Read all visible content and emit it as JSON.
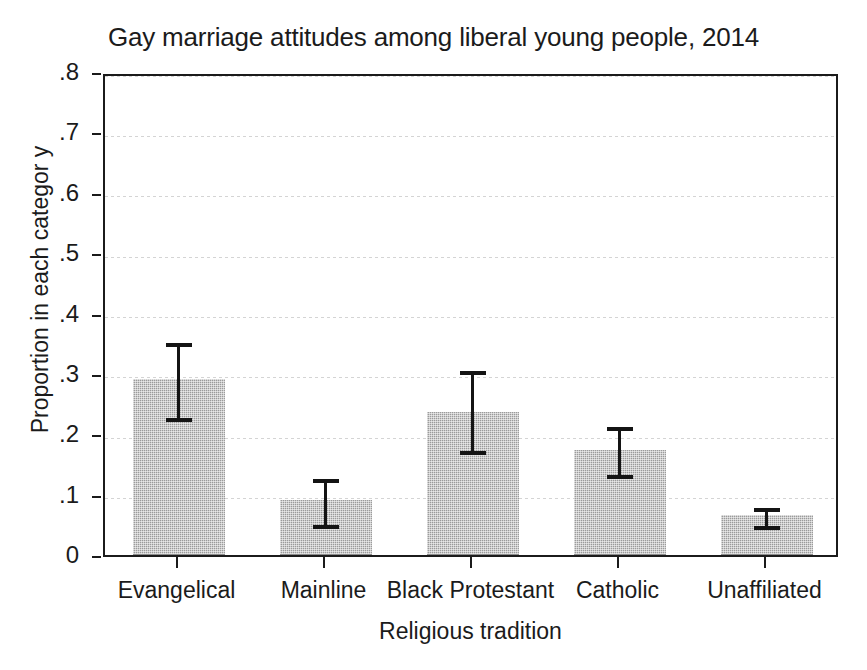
{
  "chart_data": {
    "type": "bar",
    "title": "Gay marriage attitudes among liberal young people, 2014",
    "xlabel": "Religious tradition",
    "ylabel": "Proportion in each categor y",
    "categories": [
      "Evangelical",
      "Mainline",
      "Black Protestant",
      "Catholic",
      "Unaffiliated"
    ],
    "values": [
      0.29,
      0.09,
      0.235,
      0.173,
      0.065
    ],
    "error_low": [
      0.231,
      0.053,
      0.175,
      0.136,
      0.052
    ],
    "error_high": [
      0.355,
      0.129,
      0.308,
      0.216,
      0.081
    ],
    "ylim": [
      0,
      0.8
    ],
    "yticks": [
      0,
      0.1,
      0.2,
      0.3,
      0.4,
      0.5,
      0.6,
      0.7,
      0.8
    ],
    "ytick_labels": [
      "0",
      ".1",
      ".2",
      ".3",
      ".4",
      ".5",
      ".6",
      ".7",
      ".8"
    ],
    "grid": true,
    "legend": false,
    "bar_color": "#9b9b9b",
    "error_bar_color": "#141414",
    "axis_color": "#1b1b1b",
    "gridline_color": "#d2d2d2"
  }
}
